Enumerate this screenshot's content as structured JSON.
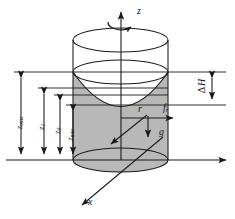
{
  "figure": {
    "kind": "rotating-fluid-cylinder-diagram",
    "fill_color": "#b8b8b8",
    "line_color": "#1a1a1a",
    "background": "#ffffff"
  },
  "axes": {
    "z_label": "z",
    "x_label": "x",
    "rotation_icon": "curved-rotation-arrow"
  },
  "dimensions": [
    {
      "id": "zmax",
      "base": "z",
      "sub": "max",
      "x": 21,
      "top": 72,
      "bottom": 160
    },
    {
      "id": "z1",
      "base": "z",
      "sub": "1",
      "x": 44,
      "top": 88,
      "bottom": 160
    },
    {
      "id": "z0",
      "base": "z",
      "sub": "0",
      "x": 60,
      "top": 95,
      "bottom": 160
    },
    {
      "id": "zmin",
      "base": "z",
      "sub": "min",
      "x": 73,
      "top": 105,
      "bottom": 160
    }
  ],
  "delta_h": {
    "delta": "Δ",
    "base": "H",
    "x": 212,
    "top": 72,
    "bottom": 105
  },
  "vectors": {
    "radius": "r",
    "force_base": "f",
    "force_sub": "r",
    "gravity": "g"
  },
  "geometry": {
    "cylinder_left": 73,
    "cylinder_right": 168,
    "axis_x": 121,
    "rim_y": 40,
    "level_y": 72,
    "vertex_y": 105,
    "base_y": 160,
    "ellipse_rx": 47,
    "ellipse_ry": 12
  }
}
